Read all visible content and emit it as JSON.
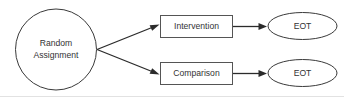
{
  "diagram": {
    "colors": {
      "background": "#ffffff",
      "shape_stroke": "#3a3a3a",
      "box_stroke": "#555555",
      "arrow": "#2b2b2b",
      "text": "#333333",
      "rule": "#e2e2e2"
    },
    "nodes": {
      "source": {
        "shape": "circle",
        "line1": "Random",
        "line2": "Assignment"
      },
      "arm_intervention": {
        "shape": "rectangle",
        "label": "Intervention"
      },
      "arm_comparison": {
        "shape": "rectangle",
        "label": "Comparison"
      },
      "outcome_intervention": {
        "shape": "ellipse",
        "label": "EOT"
      },
      "outcome_comparison": {
        "shape": "ellipse",
        "label": "EOT"
      }
    },
    "edges": [
      {
        "from": "source",
        "to": "arm_intervention",
        "style": "diagonal-up"
      },
      {
        "from": "source",
        "to": "arm_comparison",
        "style": "diagonal-down"
      },
      {
        "from": "arm_intervention",
        "to": "outcome_intervention",
        "style": "horizontal"
      },
      {
        "from": "arm_comparison",
        "to": "outcome_comparison",
        "style": "horizontal"
      }
    ]
  }
}
